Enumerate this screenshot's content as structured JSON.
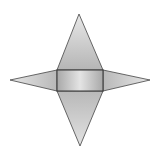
{
  "diagram": {
    "type": "pyramid-net",
    "colors": {
      "background": "#ffffff",
      "stroke": "#444444",
      "triangle_light": "#e6e6e6",
      "triangle_dark": "#b8b8b8",
      "rect_edge": "#a8a8a8",
      "rect_center": "#e4e4e4"
    },
    "base_rect": {
      "x": 57,
      "y": 70,
      "width": 46,
      "height": 21
    },
    "triangles": [
      {
        "name": "top",
        "points": "57,70 103,70 79,14"
      },
      {
        "name": "bottom",
        "points": "57,91 103,91 80,146"
      },
      {
        "name": "left",
        "points": "57,70 57,91 10,80"
      },
      {
        "name": "right",
        "points": "103,70 103,91 150,80"
      }
    ]
  }
}
